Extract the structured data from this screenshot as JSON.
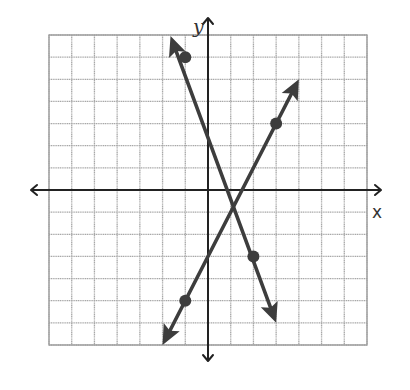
{
  "chart_data": {
    "type": "line",
    "title": "",
    "xlabel": "x",
    "ylabel": "y",
    "xlim": [
      -7,
      7
    ],
    "ylim": [
      -7,
      7
    ],
    "grid": true,
    "grid_step": 1,
    "tick_labels": false,
    "legend": null,
    "series": [
      {
        "name": "Line 1 (decreasing)",
        "equation": "y = -3x + 3",
        "slope": -3,
        "intercept": 3,
        "points": [
          [
            -1,
            6
          ],
          [
            2,
            -3
          ]
        ],
        "arrow_ends": [
          [
            -1.65,
            6.95
          ],
          [
            3.0,
            -6.0
          ]
        ]
      },
      {
        "name": "Line 2 (increasing)",
        "equation": "y = 2x - 3",
        "slope": 2,
        "intercept": -3,
        "points": [
          [
            -1,
            -5
          ],
          [
            3,
            3
          ]
        ],
        "arrow_ends": [
          [
            -2.0,
            -7.0
          ],
          [
            4.0,
            5.0
          ]
        ]
      }
    ],
    "intersection": [
      1.2,
      -0.6
    ]
  },
  "labels": {
    "x_axis": "x",
    "y_axis": "y"
  },
  "colors": {
    "lines": "#3d3d3d",
    "axes": "#222222",
    "grid": "#a8a8a8"
  }
}
